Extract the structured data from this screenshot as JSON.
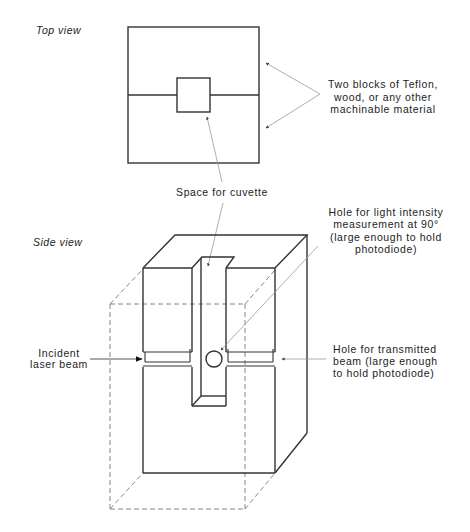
{
  "top_view": {
    "title": "Top view",
    "blocks_label": {
      "lines": [
        "Two blocks of Teflon,",
        "wood, or any other",
        "machinable material"
      ]
    },
    "cuvette_label": "Space for cuvette"
  },
  "side_view": {
    "title": "Side view",
    "hole_90_label": {
      "lines": [
        "Hole for light intensity",
        "measurement at 90°",
        "(large enough to hold",
        "photodiode)"
      ]
    },
    "incident_label": {
      "lines": [
        "Incident",
        "laser beam"
      ]
    },
    "transmitted_label": {
      "lines": [
        "Hole for transmitted",
        "beam (large enough",
        "to hold photodiode)"
      ]
    }
  },
  "colors": {
    "line": "#333333",
    "dashed": "#888888",
    "pointer": "#999999",
    "text": "#222222",
    "background": "#ffffff"
  }
}
